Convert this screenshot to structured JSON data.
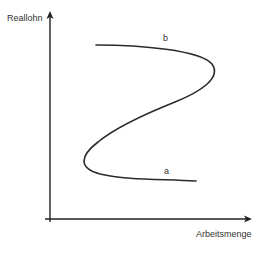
{
  "diagram": {
    "type": "economics-labor-supply-curve",
    "axes": {
      "y_label": "Reallohn",
      "x_label": "Arbeitsmenge"
    },
    "curve": {
      "description": "Backward-bending S-shaped labor supply curve",
      "point_labels": {
        "top": "b",
        "bottom": "a"
      }
    },
    "colors": {
      "axis": "#222222",
      "curve": "#2a2a2a",
      "text": "#333333",
      "background": "#ffffff"
    }
  }
}
